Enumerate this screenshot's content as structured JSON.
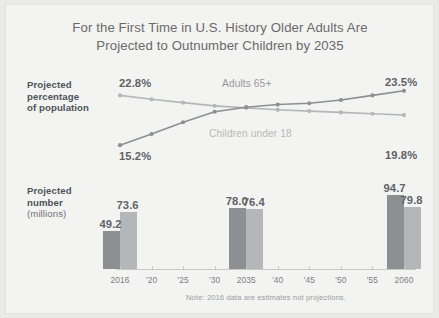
{
  "title": {
    "line1": "For the First Time in U.S. History Older Adults Are",
    "line2": "Projected to Outnumber Children by 2035"
  },
  "labels": {
    "percentage_line1": "Projected",
    "percentage_line2": "percentage",
    "percentage_line3": "of population",
    "number_line1": "Projected",
    "number_line2": "number",
    "number_line3": "(millions)"
  },
  "series_labels": {
    "adults": "Adults 65+",
    "children": "Children under 18"
  },
  "endpoint_values": {
    "children_start": "22.8%",
    "adults_start": "15.2%",
    "adults_end": "23.5%",
    "children_end": "19.8%"
  },
  "footnote": "Note: 2016 data are estimates not projections.",
  "colors": {
    "adults": "#8c9093",
    "children": "#b4b7b9",
    "title": "#6a6a6a",
    "value_text": "#5e6368",
    "background": "#f3f3f1"
  },
  "chart_data": [
    {
      "type": "line",
      "title": "Projected percentage of population",
      "xlabel": "",
      "ylabel": "Percent of population",
      "ylim": [
        14,
        25
      ],
      "grid": false,
      "legend": "inline-labels",
      "x": [
        "2016",
        "'20",
        "'25",
        "'30",
        "2035",
        "'40",
        "'45",
        "'50",
        "'55",
        "2060"
      ],
      "series": [
        {
          "name": "Children under 18",
          "color": "#b4b7b9",
          "values": [
            22.8,
            22.2,
            21.7,
            21.2,
            20.9,
            20.6,
            20.4,
            20.2,
            20.0,
            19.8
          ],
          "labels": {
            "first": "22.8%",
            "last": "19.8%"
          }
        },
        {
          "name": "Adults 65+",
          "color": "#8c9093",
          "values": [
            15.2,
            16.9,
            18.7,
            20.3,
            21.0,
            21.4,
            21.6,
            22.1,
            22.8,
            23.5
          ],
          "labels": {
            "first": "15.2%",
            "last": "23.5%"
          }
        }
      ]
    },
    {
      "type": "bar",
      "title": "Projected number (millions)",
      "xlabel": "",
      "ylabel": "Millions",
      "ylim": [
        0,
        100
      ],
      "grid": false,
      "categories": [
        "2016",
        "2035",
        "2060"
      ],
      "series": [
        {
          "name": "Adults 65+",
          "color": "#8c9093",
          "values": [
            49.2,
            78.0,
            94.7
          ]
        },
        {
          "name": "Children under 18",
          "color": "#b4b7b9",
          "values": [
            73.6,
            76.4,
            79.8
          ]
        }
      ]
    }
  ],
  "axis": {
    "ticks": [
      "2016",
      "'20",
      "'25",
      "'30",
      "2035",
      "'40",
      "'45",
      "'50",
      "'55",
      "2060"
    ]
  }
}
